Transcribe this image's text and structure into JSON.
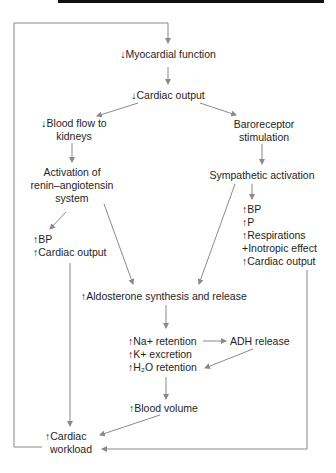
{
  "diagram": {
    "colors": {
      "text": "#1e1e1e",
      "lines": "#8a8a8a",
      "topbar": "#111111"
    },
    "nodes": {
      "myocardial": "↓Myocardial function",
      "cardiac_output_down": "↓Cardiac output",
      "blood_flow": [
        "↓Blood flow to",
        "kidneys"
      ],
      "baroreceptor": [
        "Baroreceptor",
        "stimulation"
      ],
      "renin": [
        "Activation of",
        "renin–angiotensin",
        "system"
      ],
      "sympathetic": "Sympathetic activation",
      "left_effects": [
        "↑BP",
        "↑Cardiac output"
      ],
      "right_effects": [
        "↑BP",
        "↑P",
        "↑Respirations",
        "+Inotropic effect",
        "↑Cardiac output"
      ],
      "aldosterone": "↑Aldosterone synthesis and release",
      "retention": [
        "↑Na+ retention",
        "↑K+ excretion",
        "↑H₂O retention"
      ],
      "adh": "ADH release",
      "blood_volume": "↑Blood volume",
      "workload": [
        "↑Cardiac",
        "workload"
      ]
    },
    "edges": [
      [
        "cardiac_workload",
        "myocardial_function"
      ],
      [
        "myocardial_function",
        "cardiac_output_down"
      ],
      [
        "cardiac_output_down",
        "blood_flow_to_kidneys"
      ],
      [
        "cardiac_output_down",
        "baroreceptor_stimulation"
      ],
      [
        "blood_flow_to_kidneys",
        "renin_angiotensin_activation"
      ],
      [
        "baroreceptor_stimulation",
        "sympathetic_activation"
      ],
      [
        "renin_angiotensin_activation",
        "left_effects"
      ],
      [
        "renin_angiotensin_activation",
        "aldosterone"
      ],
      [
        "sympathetic_activation",
        "right_effects"
      ],
      [
        "sympathetic_activation",
        "aldosterone"
      ],
      [
        "left_effects",
        "cardiac_workload"
      ],
      [
        "right_effects",
        "cardiac_workload"
      ],
      [
        "aldosterone",
        "retention"
      ],
      [
        "na_retention",
        "adh_release"
      ],
      [
        "adh_release",
        "h2o_retention"
      ],
      [
        "retention",
        "blood_volume"
      ],
      [
        "blood_volume",
        "cardiac_workload"
      ]
    ]
  }
}
